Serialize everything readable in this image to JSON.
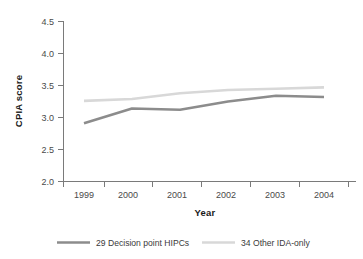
{
  "chart_data": {
    "type": "line",
    "title": "",
    "xlabel": "Year",
    "ylabel": "CPIA score",
    "categories": [
      "1999",
      "2000",
      "2001",
      "2002",
      "2003",
      "2004"
    ],
    "x": [
      1999,
      2000,
      2001,
      2002,
      2003,
      2004
    ],
    "xlim": [
      1998.5,
      2004.5
    ],
    "ylim": [
      2.0,
      4.5
    ],
    "yticks": [
      "2.0",
      "2.5",
      "3.0",
      "3.5",
      "4.0",
      "4.5"
    ],
    "ytick_values": [
      2.0,
      2.5,
      3.0,
      3.5,
      4.0,
      4.5
    ],
    "grid": false,
    "legend_position": "bottom",
    "series": [
      {
        "name": "29 Decision point HIPCs",
        "color": "#8c8c8c",
        "values": [
          2.91,
          3.14,
          3.12,
          3.25,
          3.34,
          3.32
        ]
      },
      {
        "name": "34 Other IDA-only",
        "color": "#d8d8d8",
        "values": [
          3.26,
          3.29,
          3.38,
          3.43,
          3.45,
          3.47
        ]
      }
    ]
  },
  "axes": {
    "y_label": "CPIA score",
    "x_label": "Year"
  },
  "legend": {
    "items": [
      {
        "label": "29 Decision point HIPCs",
        "color": "#8c8c8c"
      },
      {
        "label": "34 Other IDA-only",
        "color": "#d8d8d8"
      }
    ]
  },
  "colors": {
    "axis": "#7a7a7a",
    "text": "#3a3a3a",
    "background": "#ffffff"
  }
}
